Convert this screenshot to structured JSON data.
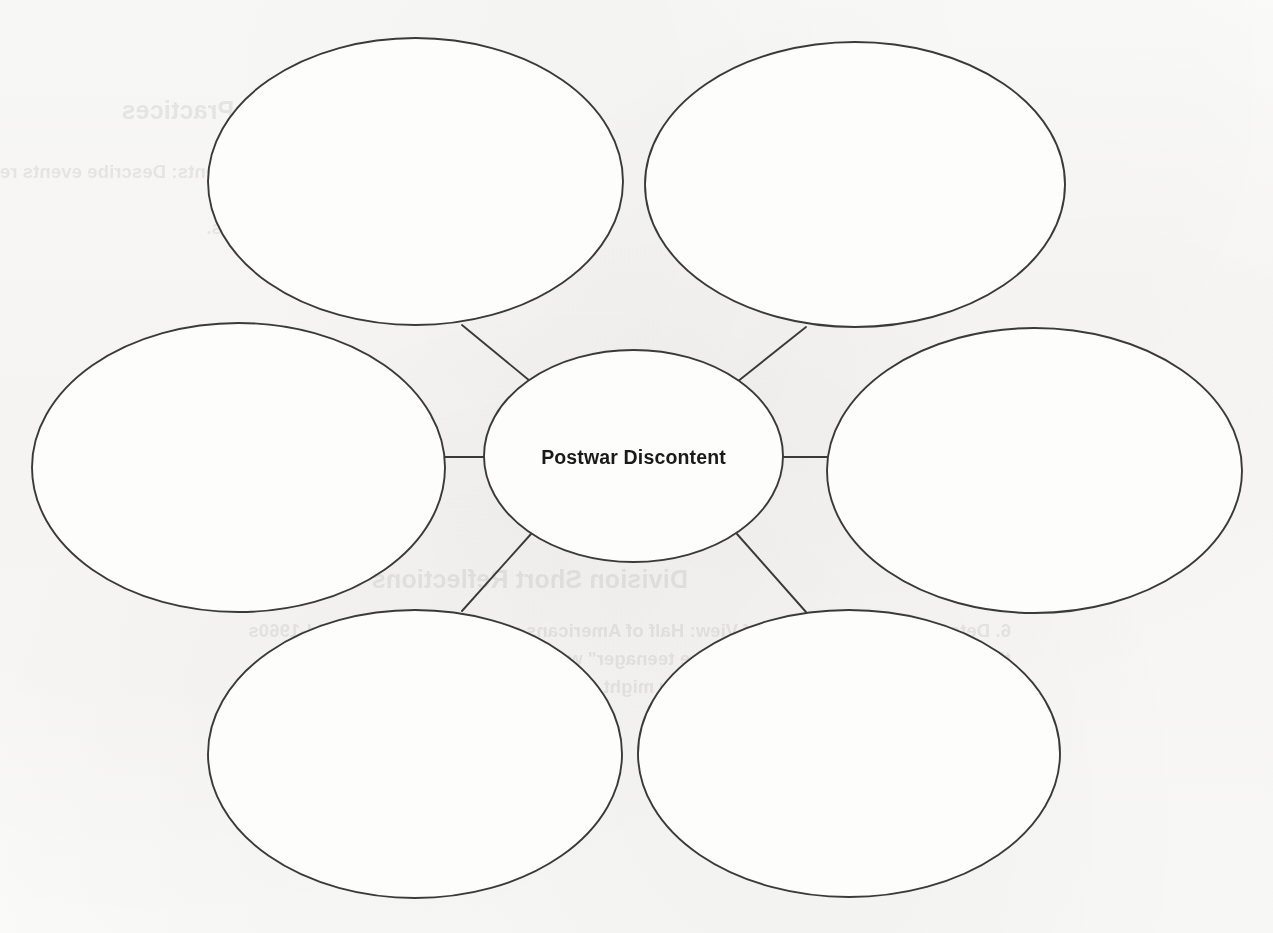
{
  "canvas": {
    "width": 1273,
    "height": 933
  },
  "colors": {
    "paper": "#fbfbfa",
    "stroke": "#3a3a3a",
    "text": "#1a1a1a",
    "bleed_text": "#2b2b2b"
  },
  "diagram": {
    "type": "concept-map",
    "layout": "radial-spoke",
    "center": {
      "label": "Postwar Discontent",
      "cx": 633.5,
      "cy": 456,
      "rx": 149.5,
      "ry": 106
    },
    "branches": [
      {
        "id": "branch-top-left",
        "label": "",
        "cx": 415.5,
        "cy": 181.5,
        "rx": 207.5,
        "ry": 143.5,
        "position": "top-left"
      },
      {
        "id": "branch-top-right",
        "label": "",
        "cx": 855,
        "cy": 184.5,
        "rx": 210,
        "ry": 142.5,
        "position": "top-right"
      },
      {
        "id": "branch-middle-left",
        "label": "",
        "cx": 238.5,
        "cy": 467.5,
        "rx": 206.5,
        "ry": 144.5,
        "position": "middle-left"
      },
      {
        "id": "branch-middle-right",
        "label": "",
        "cx": 1034.5,
        "cy": 470.5,
        "rx": 207.5,
        "ry": 142.5,
        "position": "middle-right"
      },
      {
        "id": "branch-bottom-left",
        "label": "",
        "cx": 415,
        "cy": 754,
        "rx": 207,
        "ry": 144,
        "position": "bottom-left"
      },
      {
        "id": "branch-bottom-right",
        "label": "",
        "cx": 849,
        "cy": 753.5,
        "rx": 211,
        "ry": 143.5,
        "position": "bottom-right"
      }
    ],
    "connectors": [
      {
        "id": "connector-top-left",
        "x1": 462,
        "y1": 325,
        "x2": 530,
        "y2": 381
      },
      {
        "id": "connector-top-right",
        "x1": 806,
        "y1": 327,
        "x2": 737,
        "y2": 382
      },
      {
        "id": "connector-middle-left",
        "x1": 443,
        "y1": 457,
        "x2": 485,
        "y2": 457
      },
      {
        "id": "connector-middle-right",
        "x1": 783,
        "y1": 457,
        "x2": 827,
        "y2": 457
      },
      {
        "id": "connector-bottom-left",
        "x1": 462,
        "y1": 611,
        "x2": 531,
        "y2": 534
      },
      {
        "id": "connector-bottom-right",
        "x1": 806,
        "y1": 612,
        "x2": 737,
        "y2": 534
      }
    ]
  },
  "bleed_through": {
    "note": "mirrored show-through text from the reverse side of the page",
    "blocks": [
      {
        "id": "bleed-heading-top",
        "heading": "Structured Communities & Practices",
        "left": 710,
        "top": 96
      },
      {
        "id": "bleed-item-top",
        "number": "5.",
        "line1": "Analyze Interactions Among Events: Describe events related to Northeastern",
        "line2": "education campaigns in the 1960s.",
        "left": 758,
        "top": 158
      },
      {
        "id": "bleed-heading-bottom",
        "heading": "Division Short Reflections Outline",
        "left": 585,
        "top": 565
      },
      {
        "id": "bleed-item-bottom",
        "number": "6.",
        "line1": "Determine Author's Point of View: Half of Americans reported that by the mid-1960s",
        "line2": "they believed that \"the family and the teenager\" was a topic that provoked up within",
        "line3": "the United States in a line of ways. How might children should be the implications of",
        "line4": "any of these areas.",
        "left": 262,
        "top": 617
      }
    ]
  }
}
